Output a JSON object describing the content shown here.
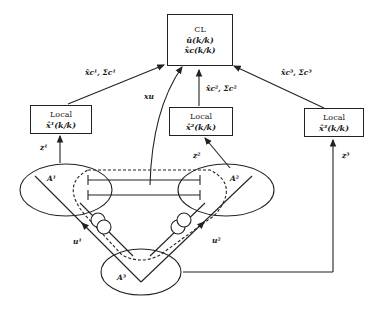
{
  "central": {
    "title": "CL",
    "line1": "û(k/k)",
    "line2": "x̂c(k/k)"
  },
  "locals": [
    {
      "title": "Local",
      "estimate": "x̂¹(k/k)"
    },
    {
      "title": "Local",
      "estimate": "x̂²(k/k)"
    },
    {
      "title": "Local",
      "estimate": "x̂³(k/k)"
    }
  ],
  "edge_labels": {
    "to_cl_1": "x̂c¹, Σc¹",
    "to_cl_2": "x̂c², Σc²",
    "to_cl_3": "x̂c³, Σc³",
    "xu": "xu",
    "z1": "z¹",
    "z2": "z²",
    "z3": "z³",
    "u1": "u¹",
    "u2": "u²"
  },
  "areas": {
    "a1": "A¹",
    "a2": "A²",
    "a3": "A³"
  }
}
